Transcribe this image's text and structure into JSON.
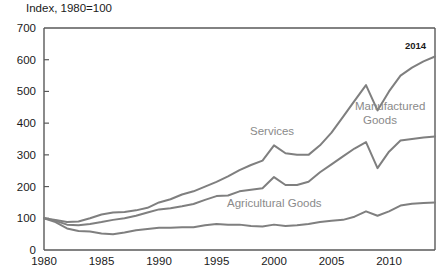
{
  "chart_data": {
    "type": "line",
    "title": "Index, 1980=100",
    "xlabel": "",
    "ylabel": "",
    "xlim": [
      1980,
      2014
    ],
    "ylim": [
      0,
      700
    ],
    "ytick_step": 100,
    "grid": false,
    "legend_position": "inline-labels",
    "ytick_labels": [
      "700",
      "600",
      "500",
      "400",
      "300",
      "200",
      "100",
      "0"
    ],
    "ytick_values": [
      700,
      600,
      500,
      400,
      300,
      200,
      100,
      0
    ],
    "xtick_labels": [
      "1980",
      "1985",
      "1990",
      "1995",
      "2000",
      "2005",
      "2010"
    ],
    "xtick_values": [
      1980,
      1985,
      1990,
      1995,
      2000,
      2005,
      2010
    ],
    "x": [
      1980,
      1981,
      1982,
      1983,
      1984,
      1985,
      1986,
      1987,
      1988,
      1989,
      1990,
      1991,
      1992,
      1993,
      1994,
      1995,
      1996,
      1997,
      1998,
      1999,
      2000,
      2001,
      2002,
      2003,
      2004,
      2005,
      2006,
      2007,
      2008,
      2009,
      2010,
      2011,
      2012,
      2013,
      2014
    ],
    "series": [
      {
        "name": "Services",
        "color": "#7f7f7f",
        "values": [
          100,
          95,
          88,
          90,
          100,
          112,
          118,
          120,
          125,
          133,
          150,
          160,
          175,
          185,
          200,
          215,
          232,
          252,
          268,
          282,
          330,
          305,
          300,
          300,
          330,
          370,
          420,
          470,
          520,
          440,
          500,
          550,
          575,
          595,
          610
        ]
      },
      {
        "name": "Manufactured Goods",
        "color": "#7f7f7f",
        "values": [
          100,
          92,
          80,
          78,
          82,
          88,
          95,
          100,
          108,
          118,
          128,
          132,
          138,
          145,
          158,
          170,
          172,
          185,
          190,
          195,
          230,
          205,
          205,
          215,
          245,
          270,
          295,
          320,
          340,
          258,
          310,
          345,
          350,
          355,
          358
        ]
      },
      {
        "name": "Agricultural Goods",
        "color": "#7f7f7f",
        "values": [
          100,
          88,
          68,
          60,
          58,
          52,
          50,
          55,
          62,
          66,
          70,
          70,
          72,
          72,
          78,
          82,
          80,
          80,
          76,
          74,
          80,
          76,
          78,
          82,
          88,
          92,
          95,
          105,
          122,
          108,
          122,
          140,
          146,
          148,
          150
        ]
      }
    ],
    "series_labels": [
      {
        "text": "Services",
        "x": 250,
        "y": 124
      },
      {
        "text": "Manufactured",
        "x": 355,
        "y": 99
      },
      {
        "text": "Goods",
        "x": 363,
        "y": 113
      },
      {
        "text": "Agricultural Goods",
        "x": 227,
        "y": 196
      }
    ],
    "annotations": [
      {
        "text": "2014",
        "x": 405,
        "y": 40
      }
    ],
    "axis_color": "#595959",
    "text_color": "#1a1a1a",
    "label_color": "#8a8a8a"
  }
}
